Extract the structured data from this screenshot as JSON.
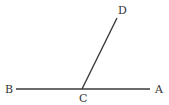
{
  "diagram": {
    "type": "geometry-angle",
    "stroke_color": "#3a3a3a",
    "label_color": "#333333",
    "points": [
      {
        "id": "A",
        "label": "A",
        "x": 150,
        "y": 89,
        "label_x": 158,
        "label_y": 93
      },
      {
        "id": "B",
        "label": "B",
        "x": 16,
        "y": 89,
        "label_x": 5,
        "label_y": 93
      },
      {
        "id": "C",
        "label": "C",
        "x": 82,
        "y": 89,
        "label_x": 79,
        "label_y": 102
      },
      {
        "id": "D",
        "label": "D",
        "x": 117,
        "y": 18,
        "label_x": 118,
        "label_y": 14
      }
    ],
    "segments": [
      {
        "from": "B",
        "to": "A"
      },
      {
        "from": "C",
        "to": "D"
      }
    ]
  }
}
